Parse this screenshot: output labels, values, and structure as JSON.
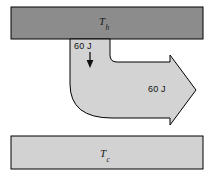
{
  "figure": {
    "name": "heat-flow-diagram",
    "background_color": "#ffffff"
  },
  "hot_reservoir": {
    "symbol": "T",
    "subscript": "h",
    "fill_color": "#8c8c8c",
    "stroke_color": "#000000"
  },
  "cold_reservoir": {
    "symbol": "T",
    "subscript": "c",
    "fill_color": "#d2d2d2",
    "stroke_color": "#000000"
  },
  "heat_in": {
    "label": "60 J",
    "direction": "down",
    "arrow_glyph": "down-arrow"
  },
  "heat_out": {
    "label": "60 J",
    "direction": "right",
    "arrow_glyph": "right-arrow"
  },
  "flow_arrow": {
    "fill_color": "#d3d3d3",
    "stroke_color": "#000000",
    "shape": "curved-elbow-arrow"
  }
}
